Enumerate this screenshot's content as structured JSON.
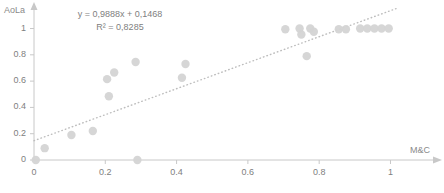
{
  "chart_data": {
    "type": "scatter",
    "title": "",
    "xlabel": "M&C",
    "ylabel": "AoLa",
    "xlim": [
      0,
      1.08
    ],
    "ylim": [
      0,
      1.08
    ],
    "grid": false,
    "legend": "none",
    "x_ticks": [
      "0",
      "0.2",
      "0.4",
      "0.6",
      "0.8",
      "1"
    ],
    "x_tick_values": [
      0,
      0.2,
      0.4,
      0.6,
      0.8,
      1
    ],
    "y_ticks": [
      "0",
      "0.2",
      "0.4",
      "0.6",
      "0.8",
      "1"
    ],
    "y_tick_values": [
      0,
      0.2,
      0.4,
      0.6,
      0.8,
      1
    ],
    "marker_color": "#d4d4d4",
    "trendline_color": "#bdbdbd",
    "trendline_style": "dotted",
    "axis_color": "#c8c8c8",
    "text_color": "#808080",
    "points": [
      {
        "x": 0.005,
        "y": 0.0
      },
      {
        "x": 0.03,
        "y": 0.09
      },
      {
        "x": 0.105,
        "y": 0.19
      },
      {
        "x": 0.165,
        "y": 0.22
      },
      {
        "x": 0.21,
        "y": 0.485
      },
      {
        "x": 0.205,
        "y": 0.615
      },
      {
        "x": 0.225,
        "y": 0.665
      },
      {
        "x": 0.285,
        "y": 0.745
      },
      {
        "x": 0.29,
        "y": 0.0
      },
      {
        "x": 0.415,
        "y": 0.625
      },
      {
        "x": 0.425,
        "y": 0.73
      },
      {
        "x": 0.705,
        "y": 0.995
      },
      {
        "x": 0.745,
        "y": 1.0
      },
      {
        "x": 0.75,
        "y": 0.955
      },
      {
        "x": 0.775,
        "y": 1.0
      },
      {
        "x": 0.785,
        "y": 0.975
      },
      {
        "x": 0.765,
        "y": 0.79
      },
      {
        "x": 0.855,
        "y": 0.995
      },
      {
        "x": 0.875,
        "y": 0.995
      },
      {
        "x": 0.915,
        "y": 1.0
      },
      {
        "x": 0.935,
        "y": 1.0
      },
      {
        "x": 0.955,
        "y": 1.0
      },
      {
        "x": 0.975,
        "y": 1.0
      },
      {
        "x": 0.995,
        "y": 1.0
      }
    ],
    "trendline": {
      "slope": 0.9888,
      "intercept": 0.1468,
      "x_start": 0.0,
      "x_end": 1.02
    },
    "annotations": {
      "equation": "y = 0,9888x + 0,1468",
      "r_squared": "R² = 0,8285"
    }
  }
}
